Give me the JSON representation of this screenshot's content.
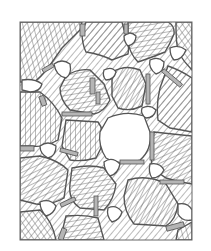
{
  "figure": {
    "title": "Polycrystalline grain microstructure schematic",
    "colors": {
      "background": "#ffffff",
      "line": "#555555",
      "hatch": "#666666",
      "boundary_fill": "#bbbbbb"
    },
    "frame": {
      "x": 20,
      "y": 22,
      "width": 172,
      "height": 218
    },
    "legend": []
  }
}
